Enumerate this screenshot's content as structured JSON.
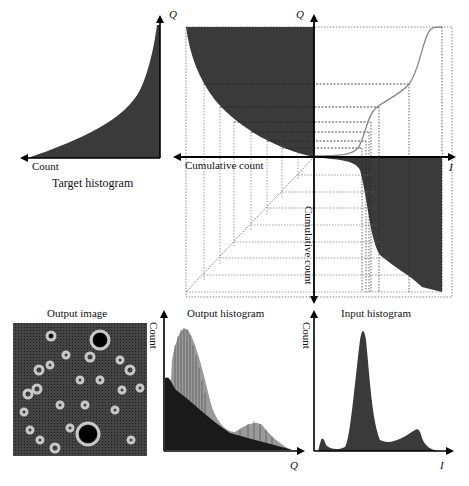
{
  "diagram": {
    "type": "histogram-matching",
    "target_histogram": {
      "title": "Target histogram",
      "x_axis_label": "Count",
      "y_axis_label": "Q"
    },
    "mapping_panel": {
      "top_axis_label": "Q",
      "right_axis_label": "I",
      "left_axis_label": "Cumulative count",
      "down_axis_label": "Cumulative count"
    },
    "output_image": {
      "title": "Output image"
    },
    "output_histogram": {
      "title": "Output histogram",
      "y_axis_label": "Count",
      "x_axis_label": "Q"
    },
    "input_histogram": {
      "title": "Input histogram",
      "y_axis_label": "Count",
      "x_axis_label": "I"
    },
    "colors": {
      "fill": "#3a3a3a",
      "axis": "#000000",
      "curve": "#888888",
      "grid": "#555555"
    }
  }
}
